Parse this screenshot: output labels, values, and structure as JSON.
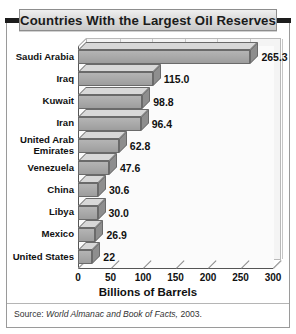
{
  "title": "Countries With the Largest Oil Reserves",
  "source": {
    "prefix": "Source: ",
    "italic": "World Almanac and Book of Facts,",
    "suffix": " 2003."
  },
  "chart_data": {
    "type": "bar",
    "orientation": "horizontal",
    "title": "Countries With the Largest Oil Reserves",
    "xlabel": "Billions of Barrels",
    "ylabel": "",
    "xlim": [
      0,
      300
    ],
    "xticks": [
      0,
      50,
      100,
      150,
      200,
      250,
      300
    ],
    "grid": true,
    "legend": false,
    "style": "3d-blocks",
    "categories": [
      "Saudi Arabia",
      "Iraq",
      "Kuwait",
      "Iran",
      "United Arab Emirates",
      "Venezuela",
      "China",
      "Libya",
      "Mexico",
      "United States"
    ],
    "values": [
      265.3,
      115.0,
      98.8,
      96.4,
      62.8,
      47.6,
      30.6,
      30.0,
      26.9,
      22
    ],
    "value_labels": [
      "265.3",
      "115.0",
      "98.8",
      "96.4",
      "62.8",
      "47.6",
      "30.6",
      "30.0",
      "26.9",
      "22"
    ],
    "colors": {
      "bar_face": "#a9a9a9",
      "bar_top": "#d8d8d8",
      "bar_side": "#8e8e8e",
      "bar_outline": "#6a6a6a",
      "plot_background": "#f4f4f4",
      "gridline": "#c6c6c6",
      "title_plate": "#dcdcdc",
      "frame": "#9a9a9a",
      "text": "#111111"
    }
  }
}
